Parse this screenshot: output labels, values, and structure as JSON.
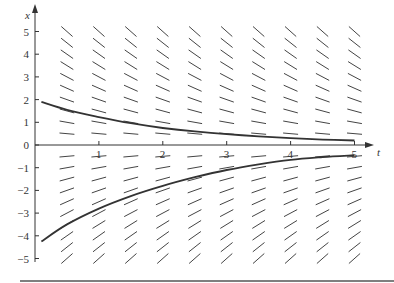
{
  "chart_data": {
    "type": "line",
    "title": "",
    "subtitle": "Slope field (direction field) with two solution curves",
    "xlabel": "t",
    "ylabel": "x",
    "xlim": [
      0,
      5.3
    ],
    "ylim": [
      -5,
      5.3
    ],
    "x_ticks": [
      1,
      2,
      3,
      4,
      5
    ],
    "y_ticks": [
      5,
      4,
      3,
      2,
      1,
      0,
      -1,
      -2,
      -3,
      -4,
      -5
    ],
    "grid": false,
    "legend": null,
    "slope_field": {
      "equation": "dx/dt = -x/2",
      "k": 0.5,
      "t_values": [
        0.5,
        1.0,
        1.5,
        2.0,
        2.5,
        3.0,
        3.5,
        4.0,
        4.5,
        5.0
      ],
      "x_values": [
        5,
        4.5,
        4,
        3.5,
        3,
        2.5,
        2,
        1.5,
        1,
        0.5,
        -0.5,
        -1,
        -1.5,
        -2,
        -2.5,
        -3,
        -3.5,
        -4,
        -4.5,
        -5
      ],
      "segment_length_px": 15
    },
    "series": [
      {
        "name": "solution-upper",
        "color": "#333333",
        "x": [
          0.1,
          0.5,
          1,
          1.5,
          2,
          2.5,
          3,
          3.5,
          4,
          4.5,
          5
        ],
        "y": [
          1.9,
          1.55,
          1.23,
          0.96,
          0.75,
          0.6,
          0.48,
          0.38,
          0.3,
          0.24,
          0.2
        ]
      },
      {
        "name": "solution-lower",
        "color": "#333333",
        "x": [
          0.1,
          0.5,
          1,
          1.5,
          2,
          2.5,
          3,
          3.5,
          4,
          4.5,
          5
        ],
        "y": [
          -4.25,
          -3.5,
          -2.8,
          -2.25,
          -1.8,
          -1.42,
          -1.1,
          -0.85,
          -0.65,
          -0.53,
          -0.45
        ]
      }
    ]
  },
  "axes": {
    "t_label": "t",
    "x_label": "x"
  }
}
